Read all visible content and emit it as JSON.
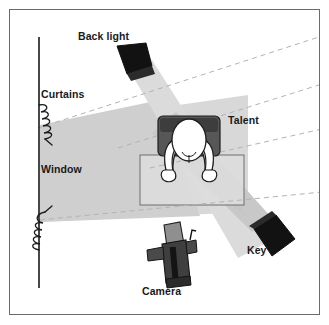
{
  "figure": {
    "type": "lighting-diagram",
    "background_color": "#ffffff",
    "border_color": "#6b6b6b",
    "labels": [
      {
        "id": "back-light",
        "text": "Back light"
      },
      {
        "id": "curtains",
        "text": "Curtains"
      },
      {
        "id": "window",
        "text": "Window"
      },
      {
        "id": "talent",
        "text": "Talent"
      },
      {
        "id": "key",
        "text": "Key"
      },
      {
        "id": "camera",
        "text": "Camera"
      }
    ],
    "elements": {
      "wall_line": {
        "name": "wall-line",
        "color": "#1a1a1a"
      },
      "curtain_top": {
        "name": "curtain-coil-top"
      },
      "curtain_bottom": {
        "name": "curtain-coil-bottom"
      },
      "window_beam": {
        "name": "window-light-beam",
        "fill": "#d5d5d5"
      },
      "window_beam_inner": {
        "name": "window-light-beam-inner",
        "fill": "#c9c9c9"
      },
      "back_light_fixture": {
        "name": "back-light-fixture",
        "fill": "#1a1a1a"
      },
      "back_light_beam": {
        "name": "back-light-beam",
        "fill": "#d9d9d9"
      },
      "key_light_fixture": {
        "name": "key-light-fixture",
        "fill": "#1a1a1a"
      },
      "key_light_beam": {
        "name": "key-light-beam",
        "fill": "#cfcfcf"
      },
      "talent_figure": {
        "name": "talent-figure",
        "skin": "#ffffff",
        "chair": "#5a5a5a"
      },
      "desk": {
        "name": "desk-rectangle",
        "fill": "#dcdcdc",
        "stroke": "#6b6b6b"
      },
      "camera_icon": {
        "name": "camera-icon",
        "fill": "#4a4a4a"
      },
      "dashed_rays": {
        "name": "dashed-sight-lines",
        "color": "#b8b8b8",
        "count": 4
      }
    },
    "colors": {
      "ink": "#1a1a1a",
      "beam_light": "#dadada",
      "beam_mid": "#c9c9c9",
      "beam_dark": "#bdbdbd",
      "dash": "#b5b5b5",
      "frame": "#6b6b6b"
    }
  }
}
